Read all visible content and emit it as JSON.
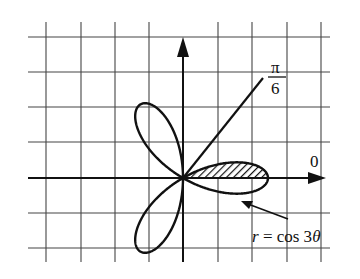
{
  "figure": {
    "type": "polar-graph",
    "curve_label": "r = cos 3θ",
    "curve_label_parts": {
      "var": "r",
      "eq": " = cos 3",
      "theta": "θ"
    },
    "angle_label": {
      "numerator": "π",
      "denominator": "6"
    },
    "axis_label_zero": "0",
    "shaded_region": "region of r = cos 3θ between θ = 0 and θ = π/6",
    "colors": {
      "ink": "#111111",
      "grid": "#444444",
      "background": "#ffffff"
    }
  },
  "chart_data": {
    "type": "polar",
    "title": "",
    "curve": "r = cos 3θ",
    "petals": 3,
    "petal_directions_rad": [
      "0",
      "2π/3",
      "4π/3"
    ],
    "max_r": 1,
    "ray": {
      "angle": "π/6",
      "label": "π/6"
    },
    "polar_axis_label": "0",
    "shaded": {
      "theta_from": "0",
      "theta_to": "π/6"
    },
    "grid": true,
    "grid_columns": 9,
    "grid_rows": 7
  }
}
